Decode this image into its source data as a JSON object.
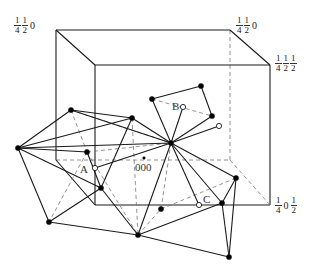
{
  "diagram": {
    "title": "",
    "colors": {
      "solid_line": "#1a1a1a",
      "dashed_line": "#777777",
      "dot_fill": "#000000",
      "open_dot_fill": "#ffffff",
      "text": "#222222"
    },
    "corner_labels": [
      {
        "id": "back-top-left",
        "parts": [
          {
            "num": "1",
            "den": "4"
          },
          {
            "num": "1",
            "den": "2"
          }
        ],
        "tail": "0",
        "x": 14,
        "y": 16
      },
      {
        "id": "back-top-right",
        "parts": [
          {
            "num": "1",
            "den": "4"
          },
          {
            "num": "1",
            "den": "2"
          }
        ],
        "tail": "0",
        "x": 236,
        "y": 16
      },
      {
        "id": "front-top-right",
        "parts": [
          {
            "num": "1",
            "den": "4"
          },
          {
            "num": "1",
            "den": "2"
          },
          {
            "num": "1",
            "den": "2"
          }
        ],
        "tail": "",
        "x": 275,
        "y": 54
      },
      {
        "id": "front-bottom-right",
        "parts": [
          {
            "num": "1",
            "den": "4"
          }
        ],
        "tail": "0",
        "tail2": {
          "num": "1",
          "den": "2"
        },
        "x": 275,
        "y": 196
      }
    ],
    "point_labels": [
      {
        "id": "A",
        "text": "A",
        "x": 80,
        "y": 163
      },
      {
        "id": "B",
        "text": "B",
        "x": 172,
        "y": 100
      },
      {
        "id": "C",
        "text": "C",
        "x": 203,
        "y": 193
      },
      {
        "id": "origin",
        "text": "000",
        "x": 135,
        "y": 161
      }
    ],
    "box": {
      "back": {
        "tl": [
          56,
          30
        ],
        "tr": [
          230,
          30
        ],
        "br": [
          230,
          160
        ],
        "bl": [
          56,
          160
        ]
      },
      "front": {
        "tl": [
          95,
          65
        ],
        "tr": [
          270,
          65
        ],
        "br": [
          270,
          205
        ],
        "bl": [
          95,
          205
        ]
      }
    },
    "vertices": {
      "H": [
        171,
        143
      ],
      "L1": [
        71,
        110
      ],
      "L2": [
        132,
        118
      ],
      "FL": [
        18,
        148
      ],
      "Ad": [
        87,
        152
      ],
      "Ao": [
        95,
        168
      ],
      "M": [
        101,
        188
      ],
      "BL": [
        49,
        222
      ],
      "BM": [
        138,
        235
      ],
      "P": [
        161,
        209
      ],
      "Co": [
        199,
        205
      ],
      "CR": [
        222,
        203
      ],
      "RT": [
        236,
        178
      ],
      "BR": [
        229,
        257
      ],
      "Bl": [
        152,
        99
      ],
      "Bt": [
        201,
        86
      ],
      "Br": [
        212,
        116
      ],
      "Bo": [
        183,
        107
      ],
      "Ro": [
        219,
        126
      ],
      "O": [
        144,
        158
      ]
    },
    "solid_edges": [
      [
        "FL",
        "L1"
      ],
      [
        "L1",
        "L2"
      ],
      [
        "FL",
        "L2"
      ],
      [
        "FL",
        "Ad"
      ],
      [
        "FL",
        "H"
      ],
      [
        "FL",
        "BL"
      ],
      [
        "FL",
        "M"
      ],
      [
        "L2",
        "H"
      ],
      [
        "L2",
        "M"
      ],
      [
        "L1",
        "H"
      ],
      [
        "Ao",
        "H"
      ],
      [
        "M",
        "BM"
      ],
      [
        "BL",
        "M"
      ],
      [
        "BL",
        "BM"
      ],
      [
        "BM",
        "H"
      ],
      [
        "BM",
        "CR"
      ],
      [
        "BM",
        "BR"
      ],
      [
        "H",
        "Co"
      ],
      [
        "H",
        "CR"
      ],
      [
        "H",
        "RT"
      ],
      [
        "RT",
        "CR"
      ],
      [
        "RT",
        "BR"
      ],
      [
        "CR",
        "BR"
      ],
      [
        "H",
        "Bl"
      ],
      [
        "H",
        "Bo"
      ],
      [
        "H",
        "Ro"
      ],
      [
        "Bl",
        "Bt"
      ],
      [
        "Bt",
        "Br"
      ],
      [
        "H",
        "Br"
      ],
      [
        "M",
        "Ad"
      ]
    ],
    "dashed_edges": [
      [
        "L1",
        "Ad"
      ],
      [
        "Ad",
        "H"
      ],
      [
        "L1",
        "H"
      ],
      [
        "Ad",
        "BL"
      ],
      [
        "Ad",
        "BM"
      ],
      [
        "BM",
        "P"
      ],
      [
        "P",
        "H"
      ],
      [
        "P",
        "RT"
      ],
      [
        "Bl",
        "Br"
      ],
      [
        "L2",
        "BM"
      ]
    ],
    "filled_points": [
      "L1",
      "L2",
      "FL",
      "Ad",
      "M",
      "BL",
      "BM",
      "P",
      "CR",
      "RT",
      "BR",
      "Bl",
      "Bt",
      "Br",
      "H"
    ],
    "open_points": [
      "Ao",
      "Co",
      "Bo",
      "Ro"
    ],
    "small_points": [
      "O"
    ]
  }
}
